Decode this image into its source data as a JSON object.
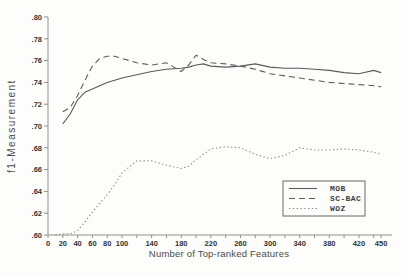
{
  "chart_data": {
    "type": "line",
    "title": "",
    "xlabel": "Number of Top-ranked Features",
    "ylabel": "f1-Measurement",
    "xlim": [
      0,
      462
    ],
    "ylim": [
      0.6,
      0.8
    ],
    "grid": false,
    "x": [
      10,
      20,
      30,
      40,
      50,
      60,
      70,
      80,
      90,
      100,
      120,
      140,
      160,
      180,
      190,
      200,
      210,
      220,
      240,
      260,
      280,
      300,
      320,
      340,
      360,
      380,
      400,
      420,
      440,
      450
    ],
    "series": [
      {
        "name": "MOB",
        "style": "solid",
        "color": "#5a5a5a",
        "values": [
          null,
          0.702,
          0.711,
          0.724,
          0.731,
          0.734,
          0.737,
          0.74,
          0.742,
          0.744,
          0.747,
          0.75,
          0.752,
          0.753,
          0.754,
          0.756,
          0.757,
          0.755,
          0.754,
          0.755,
          0.757,
          0.754,
          0.753,
          0.753,
          0.752,
          0.751,
          0.749,
          0.748,
          0.751,
          0.749
        ]
      },
      {
        "name": "SC-BAC",
        "style": "dashed",
        "color": "#5a5a5a",
        "values": [
          null,
          0.713,
          0.717,
          0.728,
          0.742,
          0.755,
          0.762,
          0.764,
          0.764,
          0.762,
          0.758,
          0.756,
          0.758,
          0.75,
          0.756,
          0.765,
          0.761,
          0.758,
          0.757,
          0.755,
          0.752,
          0.748,
          0.746,
          0.744,
          0.742,
          0.74,
          0.739,
          0.738,
          0.737,
          0.736
        ]
      },
      {
        "name": "WOZ",
        "style": "dotted",
        "color": "#8c8c8c",
        "values": [
          0.6,
          0.601,
          0.601,
          0.604,
          0.612,
          0.621,
          0.629,
          0.637,
          0.646,
          0.657,
          0.668,
          0.668,
          0.664,
          0.661,
          0.663,
          0.669,
          0.674,
          0.679,
          0.681,
          0.68,
          0.674,
          0.67,
          0.673,
          0.68,
          0.678,
          0.678,
          0.679,
          0.678,
          0.676,
          0.674
        ]
      }
    ],
    "yticks": [
      {
        "value": 0.6,
        "label": ".60"
      },
      {
        "value": 0.62,
        "label": ".62"
      },
      {
        "value": 0.64,
        "label": ".64"
      },
      {
        "value": 0.66,
        "label": ".66"
      },
      {
        "value": 0.68,
        "label": ".68"
      },
      {
        "value": 0.7,
        "label": ".70"
      },
      {
        "value": 0.72,
        "label": ".72"
      },
      {
        "value": 0.74,
        "label": ".74"
      },
      {
        "value": 0.76,
        "label": ".76"
      },
      {
        "value": 0.78,
        "label": ".78"
      },
      {
        "value": 0.8,
        "label": ".80"
      }
    ],
    "xticks": [
      {
        "value": 0,
        "label": "0"
      },
      {
        "value": 20,
        "label": "20"
      },
      {
        "value": 40,
        "label": "40"
      },
      {
        "value": 60,
        "label": "60"
      },
      {
        "value": 80,
        "label": "80"
      },
      {
        "value": 100,
        "label": "100"
      },
      {
        "value": 120,
        "label": ""
      },
      {
        "value": 140,
        "label": "140"
      },
      {
        "value": 160,
        "label": ""
      },
      {
        "value": 180,
        "label": "180"
      },
      {
        "value": 200,
        "label": ""
      },
      {
        "value": 220,
        "label": "220"
      },
      {
        "value": 240,
        "label": ""
      },
      {
        "value": 260,
        "label": "260"
      },
      {
        "value": 280,
        "label": ""
      },
      {
        "value": 300,
        "label": "300"
      },
      {
        "value": 320,
        "label": ""
      },
      {
        "value": 340,
        "label": "340"
      },
      {
        "value": 360,
        "label": ""
      },
      {
        "value": 380,
        "label": "380"
      },
      {
        "value": 400,
        "label": ""
      },
      {
        "value": 420,
        "label": "420"
      },
      {
        "value": 440,
        "label": ""
      },
      {
        "value": 450,
        "label": "450"
      }
    ],
    "legend": {
      "position": "inside lower-right",
      "entries": [
        "MOB",
        "SC-BAC",
        "WOZ"
      ]
    }
  }
}
